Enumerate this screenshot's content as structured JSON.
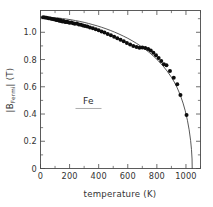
{
  "figure": {
    "background_color": "#ffffff",
    "frame_color": "#4a4a4a",
    "point_color": "#0d0d0d",
    "curve_color": "#3a3a3a"
  },
  "annotation": {
    "sample_label": "Fe"
  },
  "axis_titles": {
    "x": "temperature (K)",
    "y_prefix": "|B",
    "y_subscript": "Fermi",
    "y_suffix": "| (T)",
    "y_full": "|BFermi| (T)"
  },
  "chart_data": {
    "type": "scatter",
    "title": "",
    "subtitle": "",
    "xlabel": "temperature (K)",
    "ylabel": "|BFermi| (T)",
    "xlim": [
      0,
      1100
    ],
    "ylim": [
      0,
      1.16
    ],
    "grid": false,
    "legend_position": "none",
    "annotations": [
      {
        "text": "Fe",
        "x": 330,
        "y": 0.47,
        "underlined": true
      }
    ],
    "x_ticks_major": [
      0,
      200,
      400,
      600,
      800,
      1000
    ],
    "x_tick_labels": [
      "0",
      "200",
      "400",
      "600",
      "800",
      "1000"
    ],
    "x_ticks_minor": [
      100,
      300,
      500,
      700,
      900,
      1100
    ],
    "y_ticks_major": [
      0,
      0.2,
      0.4,
      0.6,
      0.8,
      1.0
    ],
    "y_tick_labels": [
      "0",
      "0.2",
      "0.4",
      "0.6",
      "0.8",
      "1.0"
    ],
    "y_ticks_minor": [
      0.1,
      0.3,
      0.5,
      0.7,
      0.9,
      1.1
    ],
    "series": [
      {
        "name": "experiment",
        "type": "scatter",
        "marker": "filled-circle",
        "marker_size": 2.0,
        "color": "#0d0d0d",
        "points": [
          [
            18,
            1.11
          ],
          [
            30,
            1.108
          ],
          [
            42,
            1.106
          ],
          [
            55,
            1.104
          ],
          [
            68,
            1.101
          ],
          [
            80,
            1.098
          ],
          [
            92,
            1.096
          ],
          [
            104,
            1.093
          ],
          [
            112,
            1.09
          ],
          [
            118,
            1.092
          ],
          [
            124,
            1.088
          ],
          [
            130,
            1.085
          ],
          [
            136,
            1.089
          ],
          [
            142,
            1.083
          ],
          [
            150,
            1.08
          ],
          [
            158,
            1.082
          ],
          [
            166,
            1.078
          ],
          [
            174,
            1.075
          ],
          [
            182,
            1.077
          ],
          [
            190,
            1.073
          ],
          [
            200,
            1.07
          ],
          [
            212,
            1.072
          ],
          [
            224,
            1.066
          ],
          [
            236,
            1.063
          ],
          [
            250,
            1.065
          ],
          [
            264,
            1.058
          ],
          [
            278,
            1.055
          ],
          [
            292,
            1.05
          ],
          [
            306,
            1.046
          ],
          [
            322,
            1.042
          ],
          [
            340,
            1.036
          ],
          [
            360,
            1.03
          ],
          [
            380,
            1.022
          ],
          [
            400,
            1.015
          ],
          [
            420,
            1.006
          ],
          [
            440,
            0.998
          ],
          [
            462,
            0.988
          ],
          [
            484,
            0.978
          ],
          [
            506,
            0.968
          ],
          [
            528,
            0.956
          ],
          [
            550,
            0.946
          ],
          [
            572,
            0.934
          ],
          [
            594,
            0.922
          ],
          [
            616,
            0.91
          ],
          [
            638,
            0.9
          ],
          [
            660,
            0.892
          ],
          [
            680,
            0.886
          ],
          [
            700,
            0.888
          ],
          [
            720,
            0.884
          ],
          [
            740,
            0.878
          ],
          [
            758,
            0.866
          ],
          [
            776,
            0.85
          ],
          [
            794,
            0.832
          ],
          [
            812,
            0.812
          ],
          [
            830,
            0.79
          ],
          [
            848,
            0.766
          ],
          [
            866,
            0.758
          ],
          [
            890,
            0.716
          ],
          [
            916,
            0.666
          ],
          [
            940,
            0.618
          ],
          [
            962,
            0.54
          ],
          [
            1004,
            0.392
          ]
        ]
      },
      {
        "name": "Brillouin model curve",
        "type": "line",
        "color": "#3a3a3a",
        "points": [
          [
            0,
            1.112
          ],
          [
            30,
            1.111
          ],
          [
            60,
            1.11
          ],
          [
            90,
            1.108
          ],
          [
            120,
            1.105
          ],
          [
            150,
            1.101
          ],
          [
            180,
            1.097
          ],
          [
            210,
            1.092
          ],
          [
            240,
            1.086
          ],
          [
            270,
            1.08
          ],
          [
            300,
            1.073
          ],
          [
            330,
            1.065
          ],
          [
            360,
            1.056
          ],
          [
            390,
            1.047
          ],
          [
            420,
            1.037
          ],
          [
            450,
            1.026
          ],
          [
            480,
            1.014
          ],
          [
            510,
            1.001
          ],
          [
            540,
            0.987
          ],
          [
            570,
            0.972
          ],
          [
            600,
            0.956
          ],
          [
            630,
            0.938
          ],
          [
            660,
            0.919
          ],
          [
            690,
            0.898
          ],
          [
            720,
            0.875
          ],
          [
            750,
            0.85
          ],
          [
            780,
            0.822
          ],
          [
            810,
            0.791
          ],
          [
            840,
            0.756
          ],
          [
            870,
            0.716
          ],
          [
            900,
            0.67
          ],
          [
            920,
            0.634
          ],
          [
            940,
            0.592
          ],
          [
            960,
            0.542
          ],
          [
            980,
            0.48
          ],
          [
            995,
            0.424
          ],
          [
            1010,
            0.354
          ],
          [
            1022,
            0.284
          ],
          [
            1032,
            0.205
          ],
          [
            1038,
            0.14
          ],
          [
            1042,
            0.07
          ],
          [
            1043,
            0.0
          ]
        ]
      }
    ]
  }
}
